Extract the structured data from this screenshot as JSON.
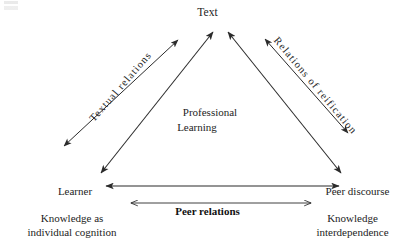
{
  "diagram": {
    "title_apex": "Text",
    "nodes": {
      "apex": {
        "label": "Text"
      },
      "bottom_left": {
        "label": "Learner",
        "sublabel_line1": "Knowledge as",
        "sublabel_line2": "individual cognition"
      },
      "bottom_right": {
        "label": "Peer discourse",
        "sublabel_line1": "Knowledge",
        "sublabel_line2": "interdependence"
      }
    },
    "center": {
      "line1": "Professional",
      "line2": "Learning"
    },
    "edges": {
      "left": {
        "label": "Textual relations"
      },
      "right": {
        "label": "Relations of reification"
      },
      "base": {
        "label": "Peer relations"
      }
    },
    "style": {
      "stroke": "#2b2b2b",
      "background": "#ffffff",
      "text_color": "#1d1d1d"
    }
  }
}
